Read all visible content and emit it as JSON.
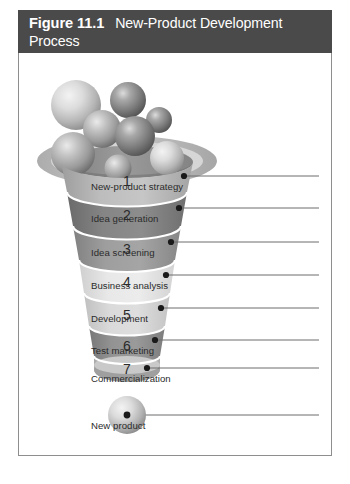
{
  "header": {
    "figure_number": "Figure 11.1",
    "title": "New-Product Development Process",
    "bar_color": "#4a4a4a",
    "text_color": "#ffffff"
  },
  "diagram": {
    "type": "funnel",
    "panel_border_color": "#8e8e8e",
    "background_color": "#ffffff",
    "leader_line_color": "#6d6d6d",
    "leader_dot_color": "#1a1a1a",
    "number_color": "#2b2b2b",
    "rim": {
      "outer_color": "#b8b8b8",
      "ring_color": "#cfcfcf",
      "inner_bowl_color": "#8f8f8f",
      "inner_shadow_color": "#7c7c7c"
    },
    "stages": [
      {
        "number": "1",
        "label": "New-product strategy",
        "band_color": "#b4b4b4"
      },
      {
        "number": "2",
        "label": "Idea generation",
        "band_color": "#7c7c7c"
      },
      {
        "number": "3",
        "label": "Idea screening",
        "band_color": "#949494"
      },
      {
        "number": "4",
        "label": "Business analysis",
        "band_color": "#e2e2e2"
      },
      {
        "number": "5",
        "label": "Development",
        "band_color": "#d3d3d3"
      },
      {
        "number": "6",
        "label": "Test marketing",
        "band_color": "#8a8a8a"
      },
      {
        "number": "7",
        "label": "Commercialization",
        "band_color": "#bdbdbd"
      }
    ],
    "output": {
      "label": "New product",
      "sphere_color": "#c4c4c4"
    },
    "input_spheres": [
      {
        "id": "sphere-1",
        "shade": "light"
      },
      {
        "id": "sphere-2",
        "shade": "dark"
      },
      {
        "id": "sphere-3",
        "shade": "medium"
      },
      {
        "id": "sphere-4",
        "shade": "dark"
      },
      {
        "id": "sphere-5",
        "shade": "dark"
      },
      {
        "id": "sphere-6",
        "shade": "medium"
      },
      {
        "id": "sphere-7",
        "shade": "light"
      },
      {
        "id": "sphere-8",
        "shade": "medium"
      }
    ]
  }
}
